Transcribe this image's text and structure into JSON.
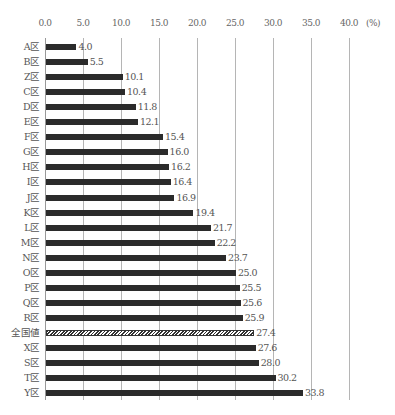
{
  "chart_data": {
    "type": "bar",
    "orientation": "horizontal",
    "title": "",
    "xlabel": "",
    "ylabel": "",
    "unit_label": "(%)",
    "xlim": [
      0,
      40
    ],
    "x_ticks": [
      "0.0",
      "5.0",
      "10.0",
      "15.0",
      "20.0",
      "25.0",
      "30.0",
      "35.0",
      "40.0"
    ],
    "grid": true,
    "legend": null,
    "categories": [
      "A区",
      "B区",
      "Z区",
      "C区",
      "D区",
      "E区",
      "F区",
      "G区",
      "H区",
      "I区",
      "J区",
      "K区",
      "L区",
      "M区",
      "N区",
      "O区",
      "P区",
      "Q区",
      "R区",
      "全国値",
      "X区",
      "S区",
      "T区",
      "Y区"
    ],
    "values": [
      4.0,
      5.5,
      10.1,
      10.4,
      11.8,
      12.1,
      15.4,
      16.0,
      16.2,
      16.4,
      16.9,
      19.4,
      21.7,
      22.2,
      23.7,
      25.0,
      25.5,
      25.6,
      25.9,
      27.4,
      27.6,
      28.0,
      30.2,
      33.8
    ],
    "value_labels": [
      "4.0",
      "5.5",
      "10.1",
      "10.4",
      "11.8",
      "12.1",
      "15.4",
      "16.0",
      "16.2",
      "16.4",
      "16.9",
      "19.4",
      "21.7",
      "22.2",
      "23.7",
      "25.0",
      "25.5",
      "25.6",
      "25.9",
      "27.4",
      "27.6",
      "28.0",
      "30.2",
      "33.8"
    ],
    "highlight": {
      "category": "全国値",
      "style": "hatched"
    },
    "colors": {
      "bar": "#2b2b2b",
      "grid": "#b5b5b5",
      "text": "#555555"
    }
  }
}
